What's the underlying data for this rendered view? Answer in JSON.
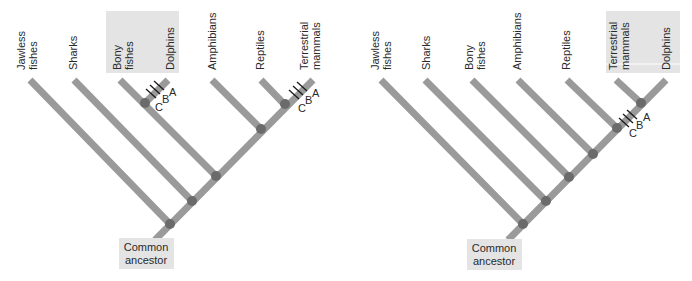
{
  "diagrams": [
    {
      "id": "left",
      "description": "Cladogram where dolphins group with bony fishes",
      "taxa": [
        {
          "lines": [
            "Jawless",
            "fishes"
          ]
        },
        {
          "lines": [
            "Sharks"
          ]
        },
        {
          "lines": [
            "Bony",
            "fishes"
          ],
          "highlighted": true
        },
        {
          "lines": [
            "Dolphins"
          ],
          "highlighted": true
        },
        {
          "lines": [
            "Amphibians"
          ]
        },
        {
          "lines": [
            "Reptiles"
          ]
        },
        {
          "lines": [
            "Terrestrial",
            "mammals"
          ]
        }
      ],
      "character_marks": [
        "C",
        "B",
        "A"
      ],
      "root_label": [
        "Common",
        "ancestor"
      ]
    },
    {
      "id": "right",
      "description": "Cladogram where dolphins group with terrestrial mammals",
      "taxa": [
        {
          "lines": [
            "Jawless",
            "fishes"
          ]
        },
        {
          "lines": [
            "Sharks"
          ]
        },
        {
          "lines": [
            "Bony",
            "fishes"
          ]
        },
        {
          "lines": [
            "Amphibians"
          ]
        },
        {
          "lines": [
            "Reptiles"
          ]
        },
        {
          "lines": [
            "Terrestrial",
            "mammals"
          ],
          "highlighted": true
        },
        {
          "lines": [
            "Dolphins"
          ],
          "highlighted": true
        }
      ],
      "character_marks": [
        "C",
        "B",
        "A"
      ],
      "root_label": [
        "Common",
        "ancestor"
      ]
    }
  ],
  "colors": {
    "branch": "#9a9a9a",
    "node": "#6b6b6b",
    "highlight": "#e4e4e4",
    "text": "#2a2a2a"
  }
}
